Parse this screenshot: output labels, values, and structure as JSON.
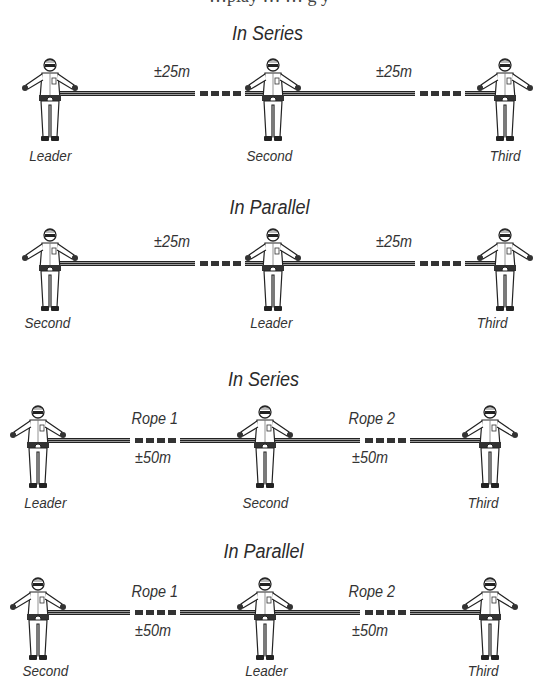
{
  "top_clipped_text": "…play …  … g  y",
  "diagrams": [
    {
      "title": "In Series",
      "roles": [
        "Leader",
        "Second",
        "Third"
      ],
      "ropes": [
        {
          "label": "",
          "distance": "±25m"
        },
        {
          "label": "",
          "distance": "±25m"
        }
      ]
    },
    {
      "title": "In Parallel",
      "roles": [
        "Second",
        "Leader",
        "Third"
      ],
      "ropes": [
        {
          "label": "",
          "distance": "±25m"
        },
        {
          "label": "",
          "distance": "±25m"
        }
      ]
    },
    {
      "title": "In Series",
      "roles": [
        "Leader",
        "Second",
        "Third"
      ],
      "ropes": [
        {
          "label": "Rope 1",
          "distance": "±50m"
        },
        {
          "label": "Rope 2",
          "distance": "±50m"
        }
      ]
    },
    {
      "title": "In Parallel",
      "roles": [
        "Second",
        "Leader",
        "Third"
      ],
      "ropes": [
        {
          "label": "Rope 1",
          "distance": "±50m"
        },
        {
          "label": "Rope 2",
          "distance": "±50m"
        }
      ]
    }
  ],
  "icons": {
    "climber": "climber-figure-icon",
    "rope": "rope-icon",
    "rope_break": "rope-break-dashes-icon"
  }
}
